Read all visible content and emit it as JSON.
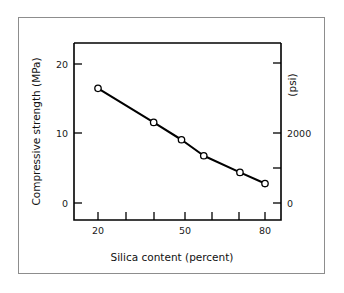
{
  "figure": {
    "background_color": "#ffffff",
    "border_color": "#8d8d8d"
  },
  "chart_data": {
    "type": "line",
    "title": "",
    "xlabel": "Silica content (percent)",
    "ylabel": "Compressive strength (MPa)",
    "y2label": "(psi)",
    "xlim": [
      12,
      88
    ],
    "ylim": [
      -2.5,
      23.5
    ],
    "y2lim": [
      -360,
      3400
    ],
    "grid": false,
    "legend": null,
    "line_color": "#000000",
    "marker": "open-circle",
    "marker_face_color": "#ffffff",
    "x": [
      20,
      40,
      50,
      58,
      71,
      80
    ],
    "y": [
      16.5,
      11.6,
      9.1,
      6.8,
      4.4,
      2.8
    ],
    "series": [
      {
        "name": "Compressive strength vs silica content",
        "x": [
          20,
          40,
          50,
          58,
          71,
          80
        ],
        "values": [
          16.5,
          11.6,
          9.1,
          6.8,
          4.4,
          2.8
        ]
      }
    ],
    "x_ticks": [
      20,
      30,
      40,
      50,
      60,
      70,
      80
    ],
    "x_tick_labels": [
      "20",
      "",
      "",
      "50",
      "",
      "",
      "80"
    ],
    "y_ticks": [
      0,
      10,
      20
    ],
    "y_tick_labels": [
      "0",
      "10",
      "20"
    ],
    "y2_ticks": [
      0,
      1000,
      2000,
      3000
    ],
    "y2_tick_labels": [
      "0",
      "",
      "2000",
      ""
    ]
  },
  "axes": {
    "x_label": "Silica content (percent)",
    "y_label": "Compressive strength (MPa)",
    "y2_label": "(psi)",
    "x_tick_20": "20",
    "x_tick_50": "50",
    "x_tick_80": "80",
    "y_tick_0": "0",
    "y_tick_10": "10",
    "y_tick_20": "20",
    "y2_tick_0": "0",
    "y2_tick_2000": "2000"
  }
}
